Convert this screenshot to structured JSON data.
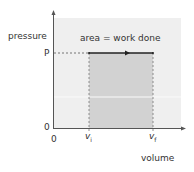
{
  "diagram": {
    "type": "pressure-volume graph",
    "y_axis_label": "pressure",
    "x_axis_label": "volume",
    "y_origin_label": "0",
    "x_origin_label": "0",
    "pressure_label": "P",
    "v_initial_label": "v",
    "v_initial_sub": "i",
    "v_final_label": "v",
    "v_final_sub": "f",
    "annotation": "area = work done",
    "colors": {
      "panel": "#efefef",
      "shaded_area": "#d2d2d2",
      "axis": "#555555",
      "line": "#222222"
    }
  }
}
